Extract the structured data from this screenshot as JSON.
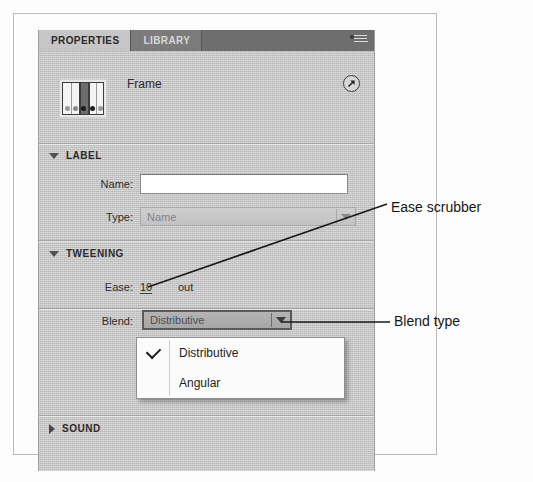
{
  "panel": {
    "tabs": [
      {
        "label": "PROPERTIES",
        "active": true
      },
      {
        "label": "LIBRARY",
        "active": false
      }
    ],
    "menu_icon": "panel-menu-icon",
    "object_title": "Frame",
    "thumbnail_icon": "frame-timeline-thumbnail",
    "expand_icon": "diagonal-arrow-icon",
    "sections": [
      {
        "id": "label",
        "title": "LABEL",
        "expanded": true,
        "triangle": "triangle-down-icon",
        "fields": [
          {
            "label": "Name:",
            "type": "text",
            "value": "",
            "placeholder": ""
          },
          {
            "label": "Type:",
            "type": "select",
            "value": "Name",
            "disabled": true,
            "arrow_icon": "chevron-down-icon"
          }
        ]
      },
      {
        "id": "tweening",
        "title": "TWEENING",
        "expanded": true,
        "triangle": "triangle-down-icon",
        "fields": [
          {
            "label": "Ease:",
            "type": "scrubber",
            "value": "10",
            "suffix": "out"
          },
          {
            "label": "Blend:",
            "type": "select",
            "value": "Distributive",
            "disabled": false,
            "active": true,
            "arrow_icon": "chevron-down-icon"
          }
        ]
      },
      {
        "id": "sound",
        "title": "SOUND",
        "expanded": false,
        "triangle": "triangle-right-icon",
        "fields": []
      }
    ]
  },
  "dropdown": {
    "open": true,
    "items": [
      {
        "label": "Distributive",
        "checked": true,
        "check_icon": "checkmark-icon"
      },
      {
        "label": "Angular",
        "checked": false,
        "check_icon": ""
      }
    ]
  },
  "annotations": [
    {
      "id": "ease-scrubber",
      "text": "Ease scrubber"
    },
    {
      "id": "blend-type",
      "text": "Blend type"
    }
  ],
  "colors": {
    "panel_bg": "#c9c9c9",
    "tabbar_bg": "#6e6e6e",
    "tab_active_bg": "#c6c6c6",
    "text": "#2b2b2b",
    "menu_bg": "#fbfbfb",
    "annotation_text": "#161616"
  }
}
